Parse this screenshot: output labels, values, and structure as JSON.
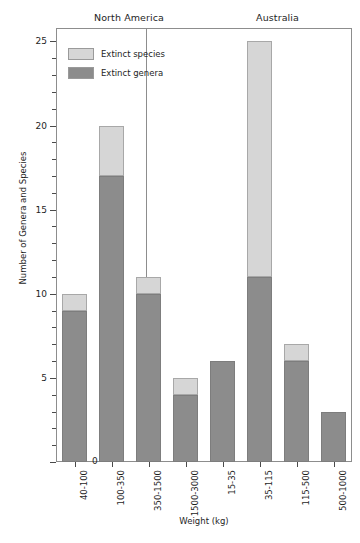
{
  "chart_data": {
    "type": "bar",
    "subtype": "stacked-bar-faceted",
    "title": "",
    "xlabel": "Weight (kg)",
    "ylabel": "Number of Genera and Species",
    "ylim": [
      0,
      25.8
    ],
    "y_ticks_major": [
      0,
      5,
      10,
      15,
      20,
      25
    ],
    "y_ticks_minor_step": 1,
    "grid": false,
    "legend_position": "top-left-inside",
    "legend": [
      {
        "label": "Extinct species",
        "color": "#d6d6d6"
      },
      {
        "label": "Extinct genera",
        "color": "#8c8c8c"
      }
    ],
    "panels": [
      {
        "name": "North America",
        "categories": [
          "40-100",
          "100-350",
          "350-1500",
          "1500-3000"
        ],
        "series": [
          {
            "name": "Extinct genera",
            "values": [
              9,
              17,
              10,
              4
            ]
          },
          {
            "name": "Extinct species",
            "values": [
              10,
              20,
              11,
              5
            ]
          }
        ]
      },
      {
        "name": "Australia",
        "categories": [
          "15-35",
          "35-115",
          "115-500",
          "500-1000"
        ],
        "series": [
          {
            "name": "Extinct genera",
            "values": [
              6,
              11,
              6,
              3
            ]
          },
          {
            "name": "Extinct species",
            "values": [
              6,
              25,
              7,
              3
            ]
          }
        ]
      }
    ]
  },
  "axes": {
    "y_title": "Number of Genera and Species",
    "x_title": "Weight (kg)",
    "y_tick_labels": [
      "0",
      "5",
      "10",
      "15",
      "20",
      "25"
    ]
  },
  "panel_titles": {
    "north_america": "North America",
    "australia": "Australia"
  },
  "legend": {
    "species_label": "Extinct species",
    "genera_label": "Extinct genera"
  },
  "colors": {
    "species": "#d6d6d6",
    "genera": "#8c8c8c",
    "frame": "#8d8d8d",
    "text": "#1e1e1e"
  }
}
